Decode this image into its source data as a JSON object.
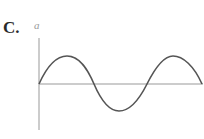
{
  "option": {
    "label": "C."
  },
  "graph": {
    "y_axis_label": "a",
    "curve": "sine wave starting at origin, rising to peak, falling below axis to trough, rising to second peak, ending on axis",
    "colors": {
      "curve": "#555555",
      "axis": "#999999"
    }
  }
}
